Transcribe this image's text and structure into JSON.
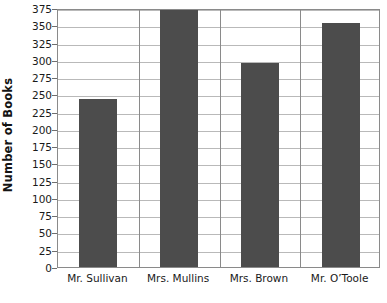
{
  "chart_data": {
    "type": "bar",
    "title": "",
    "xlabel": "",
    "ylabel": "Number of Books",
    "categories": [
      "Mr. Sullivan",
      "Mrs. Mullins",
      "Mrs. Brown",
      "Mr. O’Toole"
    ],
    "values": [
      243,
      375,
      295,
      353
    ],
    "ylim": [
      0,
      375
    ],
    "ytick_step": 25,
    "ytick_labels": [
      "0",
      "25",
      "50",
      "75",
      "100",
      "125",
      "150",
      "175",
      "200",
      "225",
      "250",
      "275",
      "300",
      "325",
      "350",
      "375"
    ],
    "ytick_values": [
      0,
      25,
      50,
      75,
      100,
      125,
      150,
      175,
      200,
      225,
      250,
      275,
      300,
      325,
      350,
      375
    ],
    "grid": true,
    "legend": false,
    "legend_position": "none",
    "bar_color": "#4c4c4c",
    "gridline_color": "#b9b9b9",
    "axis_color": "#8a8a8a",
    "background_color": "#ffffff",
    "series": [
      {
        "name": "Number of Books",
        "values": [
          243,
          375,
          295,
          353
        ]
      }
    ]
  }
}
